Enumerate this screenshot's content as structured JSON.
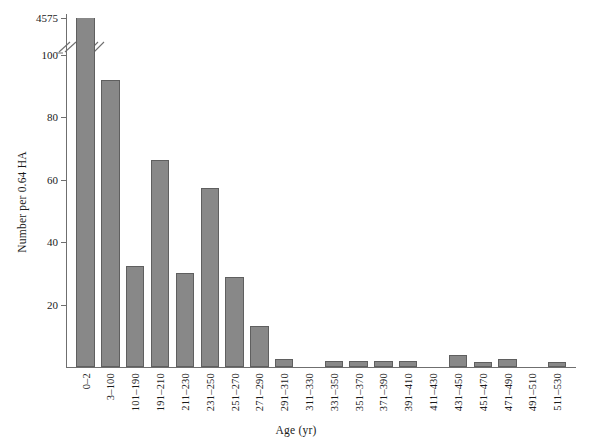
{
  "chart_data": {
    "type": "bar",
    "title": "",
    "subtitle": "",
    "xlabel": "Age (yr)",
    "ylabel": "Number per 0.64 HA",
    "grid": false,
    "legend": null,
    "ylim": [
      0,
      105
    ],
    "y_ticks": [
      20,
      40,
      60,
      80,
      100
    ],
    "y_broken_axis": true,
    "y_break_top_label": "4575",
    "y_break_note": "axis broken between 105 and 4575",
    "categories": [
      "0–2",
      "3–100",
      "101–190",
      "191–210",
      "211–230",
      "231–250",
      "251–270",
      "271–290",
      "291–310",
      "311–330",
      "331–350",
      "351–370",
      "371–390",
      "391–410",
      "411–430",
      "431–450",
      "451–470",
      "471–490",
      "491–510",
      "511–530"
    ],
    "values": [
      4575,
      92,
      32.5,
      66.5,
      30,
      57.5,
      29,
      13,
      2.5,
      0,
      2,
      2,
      2,
      2,
      0,
      4,
      1.5,
      2.5,
      0,
      1.5
    ],
    "bar_color": "#888888",
    "bar_edge_color": "#5f5f5f",
    "axis_color": "#6f6f6f"
  }
}
